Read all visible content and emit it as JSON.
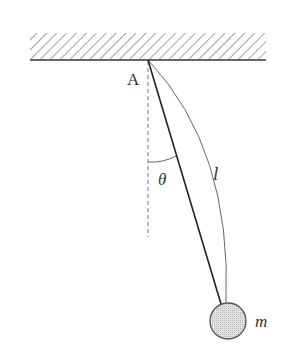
{
  "diagram": {
    "type": "simple-pendulum",
    "labels": {
      "pivot": "A",
      "angle": "θ",
      "length": "l",
      "mass": "m"
    },
    "colors": {
      "line": "#333333",
      "hatch": "#555555",
      "bob_fill": "#d4d4d4",
      "bob_stroke": "#555555",
      "dashed": "#777777"
    }
  }
}
